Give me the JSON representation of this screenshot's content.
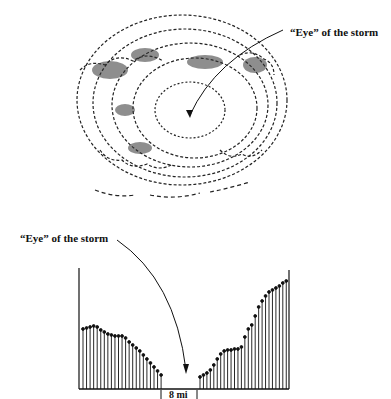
{
  "top_figure": {
    "label": "“Eye” of the storm",
    "description": "Satellite-style sketch of a hurricane cloud spiral with central eye"
  },
  "bottom_figure": {
    "label": "“Eye” of the storm",
    "scale_label": "8 mi"
  },
  "chart_data": {
    "type": "bar",
    "xlabel": "",
    "ylabel": "",
    "annotations": [
      "“Eye” of the storm",
      "8 mi"
    ],
    "left_wall": [
      60,
      61,
      62,
      63,
      62,
      59,
      57,
      55,
      54,
      53,
      53,
      53,
      51,
      47,
      44,
      41,
      38,
      34,
      30,
      26,
      22,
      18,
      14
    ],
    "gap_bars": 0,
    "right_wall": [
      12,
      14,
      16,
      19,
      24,
      30,
      35,
      38,
      39,
      39,
      40,
      40,
      42,
      52,
      60,
      64,
      73,
      82,
      88,
      93,
      97,
      99,
      101,
      103,
      106,
      108
    ],
    "grid": false
  }
}
